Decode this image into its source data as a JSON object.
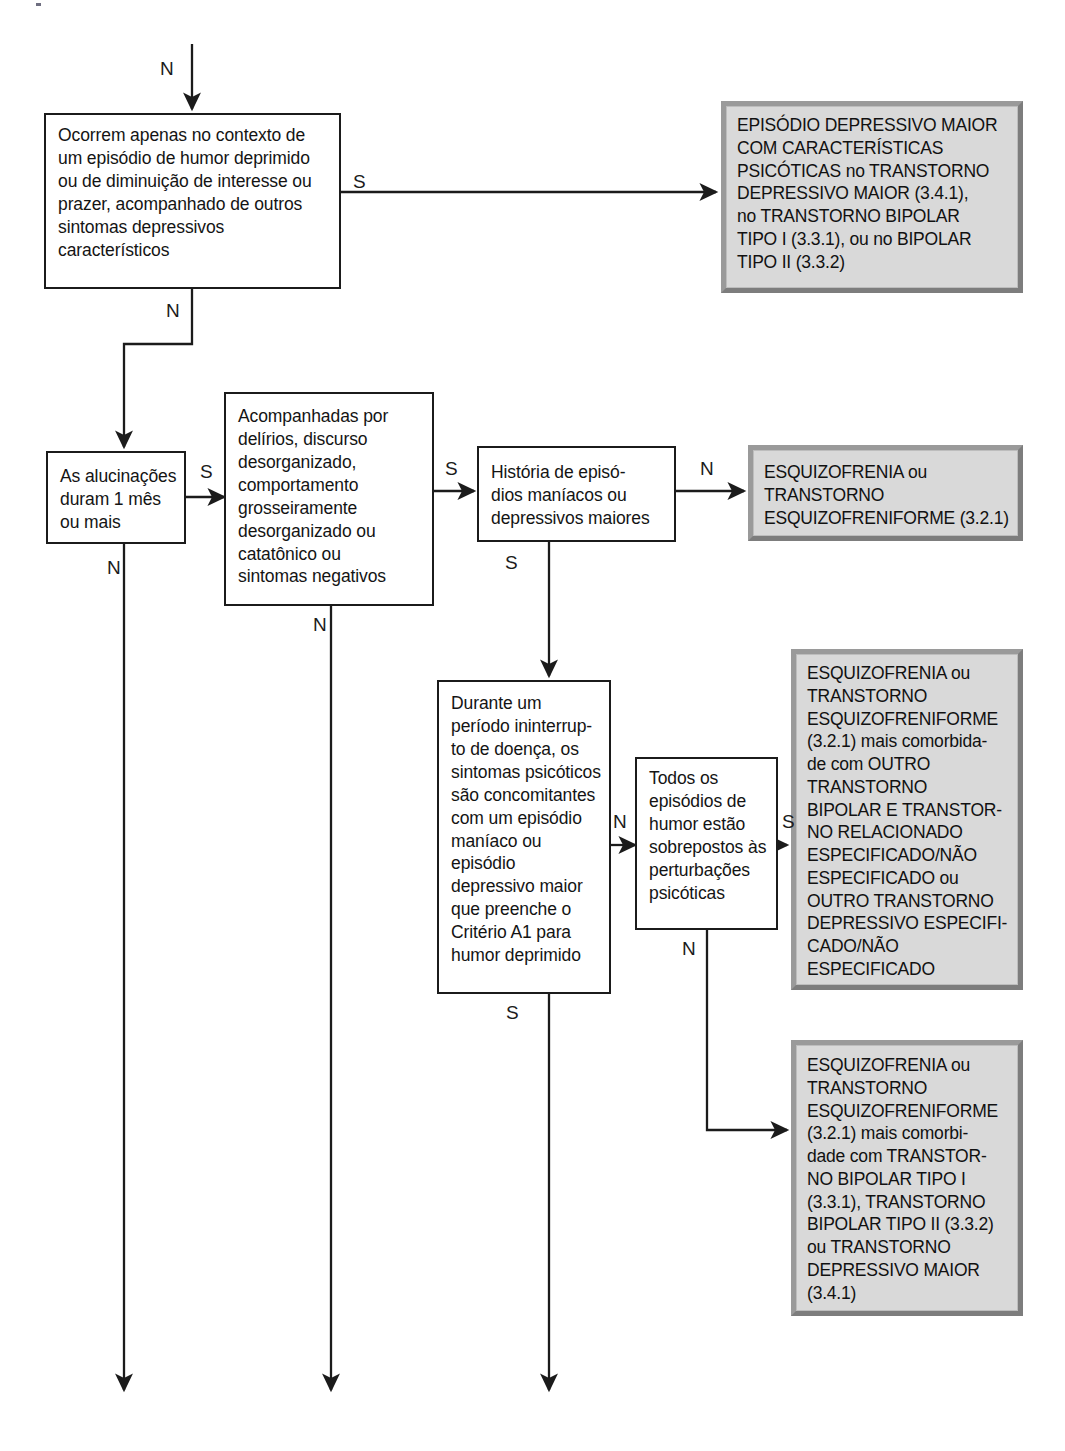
{
  "diagram": {
    "yes_label": "S",
    "no_label": "N",
    "colors": {
      "question_fill": "#ffffff",
      "question_border": "#1b1b1b",
      "outcome_fill": "#d9d9d9",
      "outcome_border": "#8d8d8d",
      "line": "#1b1b1b",
      "text": "#141414"
    }
  },
  "nodes": {
    "q_mood_context": {
      "kind": "question",
      "lines": [
        "Ocorrem apenas no contexto de",
        "um episódio de humor deprimido",
        "ou de diminuição de interesse ou",
        "prazer, acompanhado de outros",
        "sintomas depressivos",
        "característicos"
      ]
    },
    "q_duration": {
      "kind": "question",
      "lines": [
        "As alucinações",
        "duram 1 mês",
        "ou mais"
      ]
    },
    "q_accompanied": {
      "kind": "question",
      "lines": [
        "Acompanhadas por",
        "delírios, discurso",
        "desorganizado,",
        "comportamento",
        "grosseiramente",
        "desorganizado ou",
        "catatônico ou",
        "sintomas negativos"
      ]
    },
    "q_history": {
      "kind": "question",
      "lines": [
        "História de episó-",
        "dios maníacos ou",
        "depressivos maiores"
      ]
    },
    "q_uninterrupted": {
      "kind": "question",
      "lines": [
        "Durante um",
        "período ininterrup-",
        "to de doença, os",
        "sintomas psicóticos",
        "são concomitantes",
        "com um episódio",
        "maníaco ou",
        "episódio",
        "depressivo maior",
        "que preenche o",
        "Critério A1 para",
        "humor deprimido"
      ]
    },
    "q_all_episodes": {
      "kind": "question",
      "lines": [
        "Todos os",
        "episódios de",
        "humor estão",
        "sobrepostos às",
        "perturbações",
        "psicóticas"
      ]
    },
    "o_mde_psychotic": {
      "kind": "outcome",
      "lines": [
        "EPISÓDIO DEPRESSIVO MAIOR",
        "COM CARACTERÍSTICAS",
        "PSICÓTICAS no TRANSTORNO",
        "DEPRESSIVO MAIOR (3.4.1),",
        "no TRANSTORNO BIPOLAR",
        "TIPO I (3.3.1), ou no BIPOLAR",
        "TIPO II (3.3.2)"
      ]
    },
    "o_schizo_form": {
      "kind": "outcome",
      "lines": [
        "ESQUIZOFRENIA ou",
        "TRANSTORNO",
        "ESQUIZOFRENIFORME (3.2.1)"
      ]
    },
    "o_schizo_other_bipolar": {
      "kind": "outcome",
      "lines": [
        "ESQUIZOFRENIA ou",
        "TRANSTORNO",
        "ESQUIZOFRENIFORME",
        "(3.2.1) mais comorbida-",
        "de com OUTRO",
        "TRANSTORNO",
        "BIPOLAR E TRANSTOR-",
        "NO RELACIONADO",
        "ESPECIFICADO/NÃO",
        "ESPECIFICADO ou",
        "OUTRO TRANSTORNO",
        "DEPRESSIVO ESPECIFI-",
        "CADO/NÃO",
        "ESPECIFICADO"
      ]
    },
    "o_schizo_bipolar_mdd": {
      "kind": "outcome",
      "lines": [
        "ESQUIZOFRENIA ou",
        "TRANSTORNO",
        "ESQUIZOFRENIFORME",
        "(3.2.1) mais comorbi-",
        "dade com TRANSTOR-",
        "NO BIPOLAR TIPO I",
        "(3.3.1), TRANSTORNO",
        "BIPOLAR TIPO II (3.3.2)",
        "ou TRANSTORNO",
        "DEPRESSIVO MAIOR",
        "(3.4.1)"
      ]
    }
  },
  "edge_labels": {
    "entry_n": "N",
    "mood_context_yes": "S",
    "mood_context_no": "N",
    "duration_yes": "S",
    "duration_no": "N",
    "accompanied_yes": "S",
    "accompanied_no": "N",
    "history_no": "N",
    "history_yes": "S",
    "uninterrupted_yes_right": "N",
    "uninterrupted_no_down": "S",
    "all_episodes_yes": "S",
    "all_episodes_no": "N"
  }
}
